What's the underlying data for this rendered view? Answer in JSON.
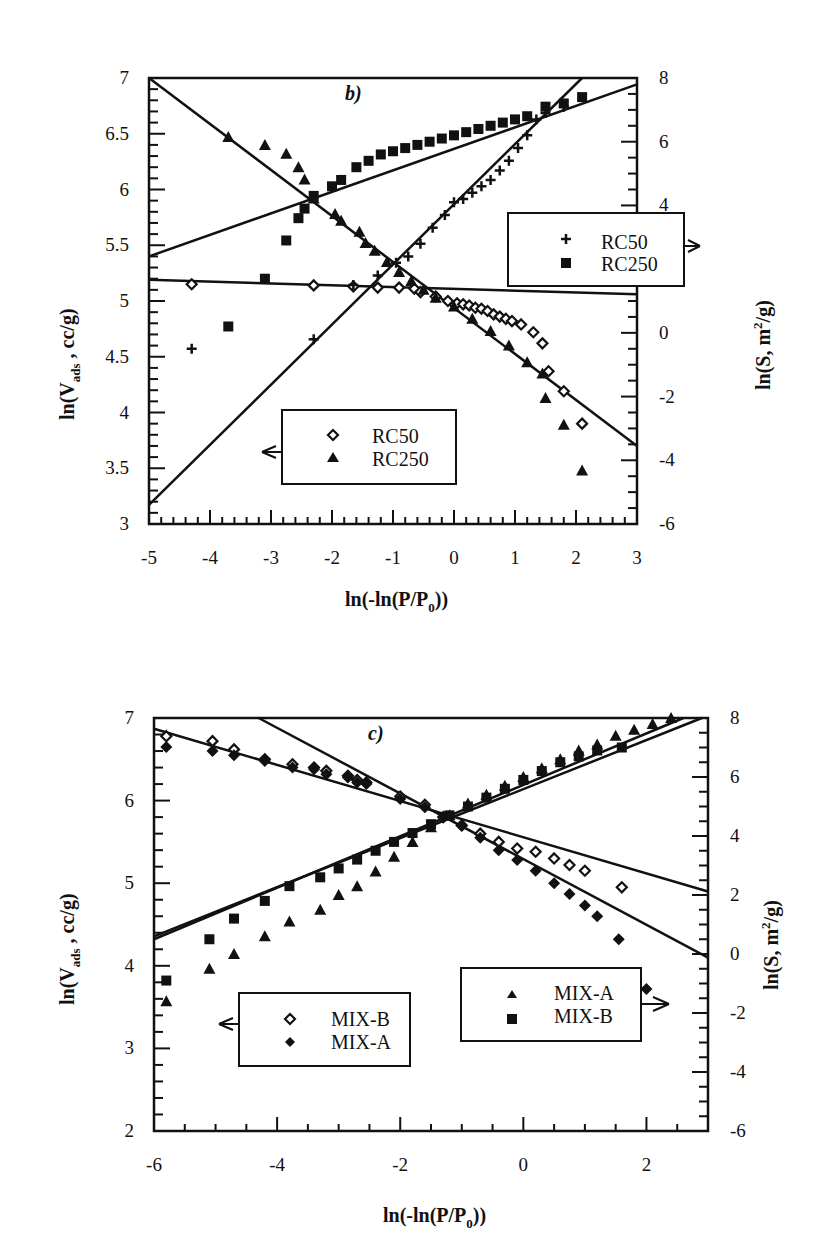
{
  "chart_data": [
    {
      "type": "scatter",
      "panel_label": "b)",
      "xlabel": "ln(-ln(P/P0))",
      "ylabel_left": "ln(Vads , cc/g)",
      "ylabel_right": "ln(S, m2/g)",
      "xlim": [
        -5,
        3
      ],
      "ylim_left": [
        3,
        7
      ],
      "ylim_right": [
        -6,
        8
      ],
      "xticks": [
        "-5",
        "-4",
        "-3",
        "-2",
        "-1",
        "0",
        "1",
        "2",
        "3"
      ],
      "yticks_left": [
        "3",
        "3.5",
        "4",
        "4.5",
        "5",
        "5.5",
        "6",
        "6.5",
        "7"
      ],
      "yticks_right": [
        "-6",
        "-4",
        "-2",
        "0",
        "2",
        "4",
        "6",
        "8"
      ],
      "legends": [
        {
          "axis": "left",
          "entries": [
            {
              "marker": "diamond-open",
              "label": "RC50"
            },
            {
              "marker": "triangle",
              "label": "RC250"
            }
          ]
        },
        {
          "axis": "right",
          "entries": [
            {
              "marker": "plus",
              "label": "RC50"
            },
            {
              "marker": "square",
              "label": "RC250"
            }
          ]
        }
      ],
      "series": [
        {
          "name": "RC50 (left, ln Vads)",
          "axis": "left",
          "marker": "diamond-open",
          "x": [
            -4.3,
            -2.3,
            -1.65,
            -1.25,
            -0.9,
            -0.65,
            -0.55,
            -0.3,
            -0.1,
            0.05,
            0.15,
            0.25,
            0.35,
            0.45,
            0.55,
            0.65,
            0.75,
            0.85,
            0.95,
            1.1,
            1.3,
            1.45,
            1.55,
            1.8,
            2.1
          ],
          "y": [
            5.15,
            5.14,
            5.13,
            5.12,
            5.12,
            5.11,
            5.08,
            5.04,
            5.0,
            4.98,
            4.97,
            4.96,
            4.94,
            4.93,
            4.91,
            4.88,
            4.86,
            4.84,
            4.82,
            4.79,
            4.72,
            4.62,
            4.37,
            4.19,
            3.9
          ]
        },
        {
          "name": "RC250 (left, ln Vads)",
          "axis": "left",
          "marker": "triangle",
          "x": [
            -3.7,
            -3.1,
            -2.75,
            -2.55,
            -2.45,
            -2.3,
            -1.95,
            -1.85,
            -1.55,
            -1.45,
            -1.3,
            -1.1,
            -0.9,
            -0.7,
            -0.5,
            -0.3,
            0.0,
            0.3,
            0.6,
            0.9,
            1.2,
            1.45,
            1.5,
            1.8,
            2.1
          ],
          "y": [
            6.47,
            6.4,
            6.32,
            6.2,
            6.09,
            5.92,
            5.78,
            5.72,
            5.62,
            5.52,
            5.45,
            5.35,
            5.26,
            5.18,
            5.1,
            5.03,
            4.95,
            4.84,
            4.73,
            4.6,
            4.45,
            4.35,
            4.13,
            3.89,
            3.48
          ]
        },
        {
          "name": "RC50 (right, ln S)",
          "axis": "right",
          "marker": "plus",
          "x": [
            -4.3,
            -2.3,
            -1.65,
            -1.25,
            -0.95,
            -0.75,
            -0.55,
            -0.35,
            -0.15,
            0.0,
            0.15,
            0.3,
            0.45,
            0.6,
            0.75,
            0.9,
            1.05,
            1.2,
            1.35,
            1.5,
            1.8
          ],
          "y": [
            -0.5,
            -0.2,
            1.5,
            1.8,
            2.2,
            2.4,
            2.8,
            3.3,
            3.7,
            4.1,
            4.2,
            4.4,
            4.6,
            4.8,
            5.1,
            5.4,
            5.8,
            6.2,
            6.7,
            6.9,
            7.1
          ]
        },
        {
          "name": "RC250 (right, ln S)",
          "axis": "right",
          "marker": "square",
          "x": [
            -3.7,
            -3.1,
            -2.75,
            -2.55,
            -2.45,
            -2.3,
            -2.0,
            -1.85,
            -1.6,
            -1.4,
            -1.2,
            -1.0,
            -0.8,
            -0.6,
            -0.4,
            -0.2,
            0.0,
            0.2,
            0.4,
            0.6,
            0.8,
            1.0,
            1.2,
            1.5,
            1.8,
            2.1
          ],
          "y": [
            0.2,
            1.7,
            2.9,
            3.6,
            3.9,
            4.3,
            4.6,
            4.8,
            5.2,
            5.4,
            5.6,
            5.7,
            5.8,
            5.9,
            6.0,
            6.1,
            6.2,
            6.3,
            6.4,
            6.5,
            6.6,
            6.7,
            6.8,
            7.1,
            7.2,
            7.4
          ]
        }
      ],
      "fit_lines": [
        {
          "axis": "left",
          "name": "RC50 fit",
          "x": [
            -5,
            3
          ],
          "y": [
            5.19,
            5.06
          ]
        },
        {
          "axis": "left",
          "name": "RC250 fit",
          "x": [
            -5,
            3
          ],
          "y": [
            7.0,
            3.7
          ]
        },
        {
          "axis": "right",
          "name": "RC50 fit",
          "x": [
            -5,
            2.1
          ],
          "y": [
            -5.4,
            8.0
          ]
        },
        {
          "axis": "right",
          "name": "RC250 fit",
          "x": [
            -5,
            3
          ],
          "y": [
            2.4,
            7.8
          ]
        }
      ]
    },
    {
      "type": "scatter",
      "panel_label": "c)",
      "xlabel": "ln(-ln(P/P0))",
      "ylabel_left": "ln(Vads , cc/g)",
      "ylabel_right": "ln(S, m2/g)",
      "xlim": [
        -6,
        3
      ],
      "ylim_left": [
        2,
        7
      ],
      "ylim_right": [
        -6,
        8
      ],
      "xticks": [
        "-6",
        "-4",
        "-2",
        "0",
        "2"
      ],
      "yticks_left": [
        "2",
        "3",
        "4",
        "5",
        "6",
        "7"
      ],
      "yticks_right": [
        "-6",
        "-4",
        "-2",
        "0",
        "2",
        "4",
        "6",
        "8"
      ],
      "legends": [
        {
          "axis": "left",
          "entries": [
            {
              "marker": "diamond-open",
              "label": "MIX-B"
            },
            {
              "marker": "diamond-filled",
              "label": "MIX-A"
            }
          ]
        },
        {
          "axis": "right",
          "entries": [
            {
              "marker": "triangle",
              "label": "MIX-A"
            },
            {
              "marker": "square",
              "label": "MIX-B"
            }
          ]
        }
      ],
      "series": [
        {
          "name": "MIX-B (left, ln Vads)",
          "axis": "left",
          "marker": "diamond-open",
          "x": [
            -5.8,
            -5.05,
            -4.7,
            -4.2,
            -3.75,
            -3.4,
            -3.2,
            -2.85,
            -2.7,
            -2.55,
            -2.0,
            -1.6,
            -1.3,
            -1.0,
            -0.7,
            -0.4,
            -0.1,
            0.2,
            0.5,
            0.75,
            1.0,
            1.6
          ],
          "y": [
            6.78,
            6.72,
            6.62,
            6.5,
            6.44,
            6.4,
            6.36,
            6.3,
            6.25,
            6.22,
            6.05,
            5.95,
            5.8,
            5.7,
            5.6,
            5.5,
            5.42,
            5.38,
            5.3,
            5.22,
            5.15,
            4.95
          ]
        },
        {
          "name": "MIX-A (left, ln Vads)",
          "axis": "left",
          "marker": "diamond-filled",
          "x": [
            -5.8,
            -5.05,
            -4.7,
            -4.2,
            -3.75,
            -3.4,
            -3.2,
            -2.85,
            -2.7,
            -2.55,
            -2.0,
            -1.6,
            -1.3,
            -1.0,
            -0.7,
            -0.4,
            -0.1,
            0.2,
            0.5,
            0.75,
            1.0,
            1.2,
            1.55,
            2.0
          ],
          "y": [
            6.65,
            6.6,
            6.55,
            6.48,
            6.4,
            6.38,
            6.32,
            6.28,
            6.22,
            6.2,
            6.02,
            5.92,
            5.8,
            5.7,
            5.55,
            5.4,
            5.28,
            5.15,
            5.0,
            4.87,
            4.73,
            4.6,
            4.32,
            3.72
          ]
        },
        {
          "name": "MIX-A (right, ln S)",
          "axis": "right",
          "marker": "triangle",
          "x": [
            -5.8,
            -5.1,
            -4.7,
            -4.2,
            -3.8,
            -3.3,
            -3.0,
            -2.7,
            -2.4,
            -2.1,
            -1.8,
            -1.5,
            -1.2,
            -0.9,
            -0.6,
            -0.3,
            0.0,
            0.3,
            0.6,
            0.9,
            1.2,
            1.5,
            1.8,
            2.1,
            2.4
          ],
          "y": [
            -1.6,
            -0.5,
            0.0,
            0.6,
            1.1,
            1.5,
            2.0,
            2.3,
            2.8,
            3.3,
            3.8,
            4.3,
            4.7,
            5.1,
            5.4,
            5.7,
            6.0,
            6.3,
            6.6,
            6.9,
            7.1,
            7.4,
            7.6,
            7.8,
            8.0
          ]
        },
        {
          "name": "MIX-B (right, ln S)",
          "axis": "right",
          "marker": "square",
          "x": [
            -5.8,
            -5.1,
            -4.7,
            -4.2,
            -3.8,
            -3.3,
            -3.0,
            -2.7,
            -2.4,
            -2.1,
            -1.8,
            -1.5,
            -1.2,
            -0.9,
            -0.6,
            -0.3,
            0.0,
            0.3,
            0.6,
            0.9,
            1.2,
            1.6
          ],
          "y": [
            -0.9,
            0.5,
            1.2,
            1.8,
            2.3,
            2.6,
            2.9,
            3.2,
            3.5,
            3.8,
            4.1,
            4.4,
            4.7,
            5.0,
            5.3,
            5.6,
            5.9,
            6.2,
            6.5,
            6.7,
            6.9,
            7.0
          ]
        }
      ],
      "fit_lines": [
        {
          "axis": "left",
          "name": "MIX-B fit",
          "x": [
            -6,
            3
          ],
          "y": [
            6.87,
            4.9
          ]
        },
        {
          "axis": "left",
          "name": "MIX-A fit",
          "x": [
            -4.3,
            3
          ],
          "y": [
            7.0,
            4.1
          ]
        },
        {
          "axis": "right",
          "name": "MIX-A fit",
          "x": [
            -6,
            2.9
          ],
          "y": [
            0.6,
            8.0
          ]
        },
        {
          "axis": "right",
          "name": "MIX-B fit",
          "x": [
            -6,
            2.6
          ],
          "y": [
            0.5,
            8.0
          ]
        }
      ]
    }
  ],
  "panels": {
    "b": {
      "label": "b)",
      "xlabel": "ln(-ln(P/P",
      "xlabel_sub": "0",
      "xlabel_end": "))",
      "ylabel_left_pre": "ln(V",
      "ylabel_left_sub": "ads",
      "ylabel_left_post": " ,  cc/g)",
      "ylabel_right_pre": "ln(S,  m",
      "ylabel_right_sup": "2",
      "ylabel_right_post": "/g)",
      "legend_left": [
        "RC50",
        "RC250"
      ],
      "legend_right": [
        "RC50",
        "RC250"
      ]
    },
    "c": {
      "label": "c)",
      "xlabel": "ln(-ln(P/P",
      "xlabel_sub": "0",
      "xlabel_end": "))",
      "ylabel_left_pre": "ln(V",
      "ylabel_left_sub": "ads",
      "ylabel_left_post": " ,  cc/g)",
      "ylabel_right_pre": "ln(S,  m",
      "ylabel_right_sup": "2",
      "ylabel_right_post": "/g)",
      "legend_left": [
        "MIX-B",
        "MIX-A"
      ],
      "legend_right": [
        "MIX-A",
        "MIX-B"
      ]
    }
  }
}
